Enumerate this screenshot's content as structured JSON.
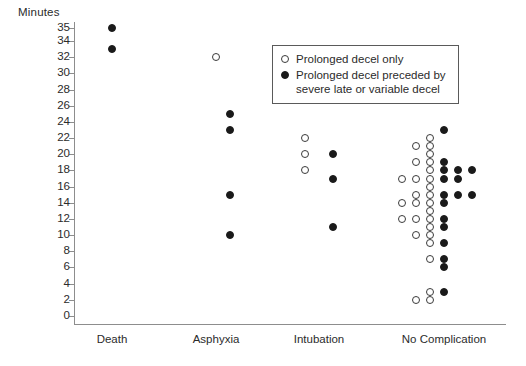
{
  "chart_data": {
    "type": "scatter",
    "title": "",
    "ylabel": "Minutes",
    "xlabel": "",
    "ylim": [
      0,
      35
    ],
    "grid": false,
    "yticks": [
      0,
      2,
      4,
      6,
      8,
      10,
      12,
      14,
      16,
      18,
      20,
      22,
      24,
      26,
      28,
      30,
      32,
      34,
      35
    ],
    "ytick_labels": [
      "0",
      "2",
      "4",
      "6",
      "8",
      "10",
      "12",
      "14",
      "16",
      "18",
      "20",
      "22",
      "24",
      "26",
      "28",
      "30",
      "32",
      "34",
      "35"
    ],
    "categories": [
      "Death",
      "Asphyxia",
      "Intubation",
      "No Complication"
    ],
    "legend": {
      "position": "top-right",
      "entries": [
        {
          "marker": "open-circle",
          "label": "Prolonged decel only"
        },
        {
          "marker": "filled-circle",
          "label": "Prolonged decel preceded by"
        },
        {
          "marker": "none",
          "label": "severe late or variable decel"
        }
      ]
    },
    "series": [
      {
        "name": "Prolonged decel only",
        "marker": "open-circle",
        "color": "#ffffff",
        "edge_color": "#3a3a3a",
        "points": [
          {
            "category": "Asphyxia",
            "offset": 0,
            "value": 32
          },
          {
            "category": "Intubation",
            "offset": -1,
            "value": 22
          },
          {
            "category": "Intubation",
            "offset": -1,
            "value": 20
          },
          {
            "category": "Intubation",
            "offset": -1,
            "value": 18
          },
          {
            "category": "No Complication",
            "offset": -3,
            "value": 17
          },
          {
            "category": "No Complication",
            "offset": -3,
            "value": 14
          },
          {
            "category": "No Complication",
            "offset": -3,
            "value": 12
          },
          {
            "category": "No Complication",
            "offset": -2,
            "value": 21
          },
          {
            "category": "No Complication",
            "offset": -2,
            "value": 19
          },
          {
            "category": "No Complication",
            "offset": -2,
            "value": 17
          },
          {
            "category": "No Complication",
            "offset": -2,
            "value": 15
          },
          {
            "category": "No Complication",
            "offset": -2,
            "value": 14
          },
          {
            "category": "No Complication",
            "offset": -2,
            "value": 12
          },
          {
            "category": "No Complication",
            "offset": -2,
            "value": 10
          },
          {
            "category": "No Complication",
            "offset": -2,
            "value": 2
          },
          {
            "category": "No Complication",
            "offset": -1,
            "value": 22
          },
          {
            "category": "No Complication",
            "offset": -1,
            "value": 21
          },
          {
            "category": "No Complication",
            "offset": -1,
            "value": 20
          },
          {
            "category": "No Complication",
            "offset": -1,
            "value": 19
          },
          {
            "category": "No Complication",
            "offset": -1,
            "value": 18
          },
          {
            "category": "No Complication",
            "offset": -1,
            "value": 17
          },
          {
            "category": "No Complication",
            "offset": -1,
            "value": 16
          },
          {
            "category": "No Complication",
            "offset": -1,
            "value": 15
          },
          {
            "category": "No Complication",
            "offset": -1,
            "value": 14
          },
          {
            "category": "No Complication",
            "offset": -1,
            "value": 13
          },
          {
            "category": "No Complication",
            "offset": -1,
            "value": 12
          },
          {
            "category": "No Complication",
            "offset": -1,
            "value": 11
          },
          {
            "category": "No Complication",
            "offset": -1,
            "value": 10
          },
          {
            "category": "No Complication",
            "offset": -1,
            "value": 9
          },
          {
            "category": "No Complication",
            "offset": -1,
            "value": 7
          },
          {
            "category": "No Complication",
            "offset": -1,
            "value": 3
          },
          {
            "category": "No Complication",
            "offset": -1,
            "value": 2
          }
        ]
      },
      {
        "name": "Prolonged decel preceded by severe late or variable decel",
        "marker": "filled-circle",
        "color": "#1a1a1a",
        "points": [
          {
            "category": "Death",
            "offset": 0,
            "value": 35
          },
          {
            "category": "Death",
            "offset": 0,
            "value": 33
          },
          {
            "category": "Asphyxia",
            "offset": 1,
            "value": 25
          },
          {
            "category": "Asphyxia",
            "offset": 1,
            "value": 23
          },
          {
            "category": "Asphyxia",
            "offset": 1,
            "value": 15
          },
          {
            "category": "Asphyxia",
            "offset": 1,
            "value": 10
          },
          {
            "category": "Intubation",
            "offset": 1,
            "value": 20
          },
          {
            "category": "Intubation",
            "offset": 1,
            "value": 17
          },
          {
            "category": "Intubation",
            "offset": 1,
            "value": 11
          },
          {
            "category": "No Complication",
            "offset": 0,
            "value": 23
          },
          {
            "category": "No Complication",
            "offset": 0,
            "value": 19
          },
          {
            "category": "No Complication",
            "offset": 0,
            "value": 18
          },
          {
            "category": "No Complication",
            "offset": 0,
            "value": 17
          },
          {
            "category": "No Complication",
            "offset": 0,
            "value": 15
          },
          {
            "category": "No Complication",
            "offset": 0,
            "value": 14
          },
          {
            "category": "No Complication",
            "offset": 0,
            "value": 12
          },
          {
            "category": "No Complication",
            "offset": 0,
            "value": 11
          },
          {
            "category": "No Complication",
            "offset": 0,
            "value": 9
          },
          {
            "category": "No Complication",
            "offset": 0,
            "value": 7
          },
          {
            "category": "No Complication",
            "offset": 0,
            "value": 6
          },
          {
            "category": "No Complication",
            "offset": 0,
            "value": 3
          },
          {
            "category": "No Complication",
            "offset": 1,
            "value": 18
          },
          {
            "category": "No Complication",
            "offset": 1,
            "value": 17
          },
          {
            "category": "No Complication",
            "offset": 1,
            "value": 15
          },
          {
            "category": "No Complication",
            "offset": 2,
            "value": 18
          },
          {
            "category": "No Complication",
            "offset": 2,
            "value": 15
          }
        ]
      }
    ]
  }
}
